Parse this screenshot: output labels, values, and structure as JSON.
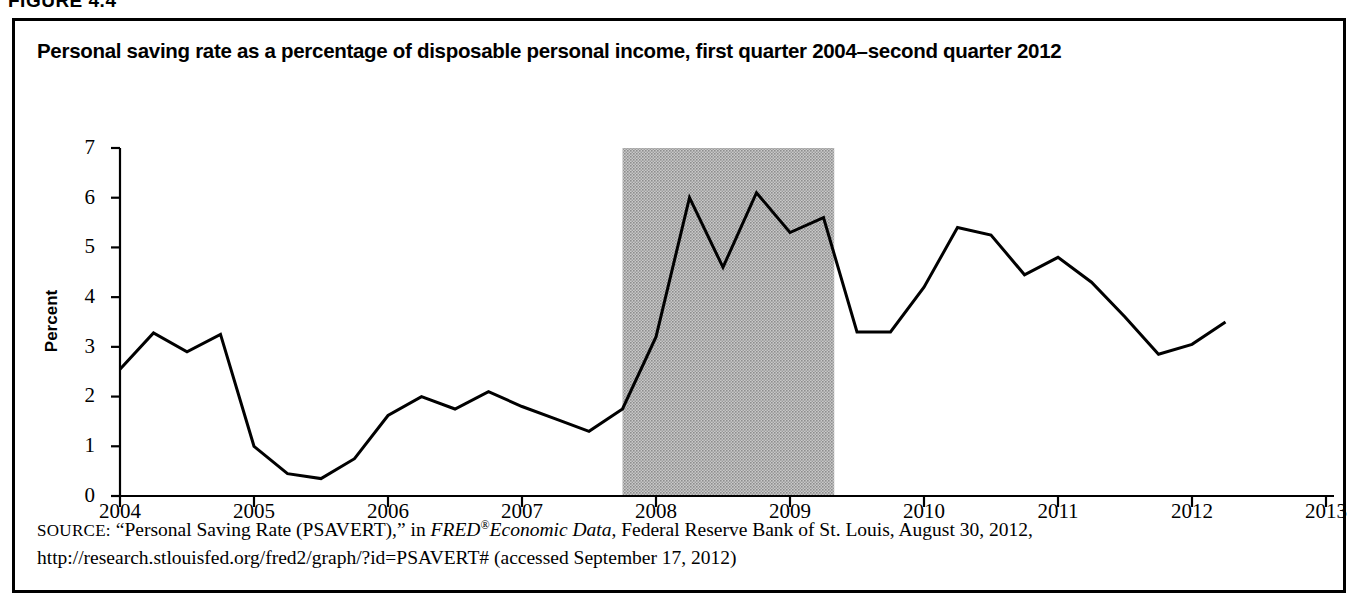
{
  "figure": {
    "label": "FIGURE 4.4",
    "title": "Personal saving rate as a percentage of disposable personal income, first quarter 2004–second quarter 2012"
  },
  "axes": {
    "ylabel": "Percent",
    "yticks": [
      "0",
      "1",
      "2",
      "3",
      "4",
      "5",
      "6",
      "7"
    ],
    "xticks": [
      "2004",
      "2005",
      "2006",
      "2007",
      "2008",
      "2009",
      "2010",
      "2011",
      "2012",
      "2013"
    ]
  },
  "source": {
    "prefix": "SOURCE:",
    "part1": " “Personal Saving Rate (PSAVERT),” in ",
    "italic1": "FRED",
    "sup": "®",
    "italic2": "Economic Data",
    "part2": ", Federal Reserve Bank of St. Louis, August 30, 2012, http://research.stlouisfed.org/fred2/graph/?id=PSAVERT# (accessed September 17, 2012)"
  },
  "chart_data": {
    "type": "line",
    "title": "Personal saving rate as a percentage of disposable personal income, first quarter 2004–second quarter 2012",
    "xlabel": "",
    "ylabel": "Percent",
    "ylim": [
      0,
      7
    ],
    "xlim": [
      2004,
      2013
    ],
    "grid": false,
    "legend": "none",
    "line_color": "#000000",
    "shading_color": "#b3b3b3",
    "recession_band": {
      "label": "recession shading",
      "start": 2007.75,
      "end": 2009.33,
      "y_top": 7
    },
    "x": [
      2004.0,
      2004.25,
      2004.5,
      2004.75,
      2005.0,
      2005.25,
      2005.5,
      2005.75,
      2006.0,
      2006.25,
      2006.5,
      2006.75,
      2007.0,
      2007.25,
      2007.5,
      2007.75,
      2008.0,
      2008.25,
      2008.5,
      2008.75,
      2009.0,
      2009.25,
      2009.5,
      2009.75,
      2010.0,
      2010.25,
      2010.5,
      2010.75,
      2011.0,
      2011.25,
      2011.5,
      2011.75,
      2012.0,
      2012.25
    ],
    "categories": [
      "2004 Q1",
      "2004 Q2",
      "2004 Q3",
      "2004 Q4",
      "2005 Q1",
      "2005 Q2",
      "2005 Q3",
      "2005 Q4",
      "2006 Q1",
      "2006 Q2",
      "2006 Q3",
      "2006 Q4",
      "2007 Q1",
      "2007 Q2",
      "2007 Q3",
      "2007 Q4",
      "2008 Q1",
      "2008 Q2",
      "2008 Q3",
      "2008 Q4",
      "2009 Q1",
      "2009 Q2",
      "2009 Q3",
      "2009 Q4",
      "2010 Q1",
      "2010 Q2",
      "2010 Q3",
      "2010 Q4",
      "2011 Q1",
      "2011 Q2",
      "2011 Q3",
      "2011 Q4",
      "2012 Q1",
      "2012 Q2"
    ],
    "values": [
      2.55,
      3.28,
      2.9,
      3.25,
      1.0,
      0.45,
      0.35,
      0.75,
      1.62,
      2.0,
      1.75,
      2.1,
      1.8,
      1.55,
      1.3,
      1.75,
      3.2,
      6.0,
      4.6,
      6.1,
      5.3,
      5.6,
      3.3,
      3.3,
      4.2,
      5.4,
      5.25,
      4.45,
      4.8,
      4.3,
      3.6,
      2.85,
      3.05,
      3.5
    ],
    "series": [
      {
        "name": "Personal saving rate",
        "values": [
          2.55,
          3.28,
          2.9,
          3.25,
          1.0,
          0.45,
          0.35,
          0.75,
          1.62,
          2.0,
          1.75,
          2.1,
          1.8,
          1.55,
          1.3,
          1.75,
          3.2,
          6.0,
          4.6,
          6.1,
          5.3,
          5.6,
          3.3,
          3.3,
          4.2,
          5.4,
          5.25,
          4.45,
          4.8,
          4.3,
          3.6,
          2.85,
          3.05,
          3.5
        ]
      }
    ]
  }
}
